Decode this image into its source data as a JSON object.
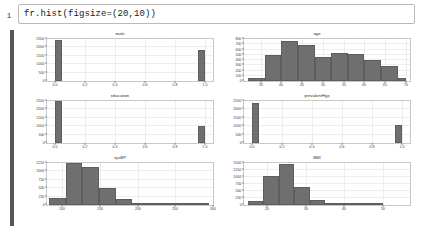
{
  "notebook": {
    "prompt_label": "1",
    "code": "fr.hist(figsize=(20,10))"
  },
  "chart_data": [
    {
      "type": "bar",
      "title": "male",
      "xlabel": "",
      "ylabel": "",
      "grid": true,
      "xlim": [
        -0.05,
        1.05
      ],
      "ylim": [
        0,
        2500
      ],
      "xticks": [
        "0.0",
        "0.2",
        "0.4",
        "0.6",
        "0.8",
        "1.0"
      ],
      "xtick_values": [
        0.0,
        0.2,
        0.4,
        0.6,
        0.8,
        1.0
      ],
      "yticks": [
        "0",
        "500",
        "1000",
        "1500",
        "2000",
        "2500"
      ],
      "ytick_values": [
        0,
        500,
        1000,
        1500,
        2000,
        2500
      ],
      "bins": [
        {
          "x0": 0.0,
          "x1": 0.05,
          "value": 2420
        },
        {
          "x0": 0.95,
          "x1": 1.0,
          "value": 1820
        }
      ]
    },
    {
      "type": "bar",
      "title": "age",
      "xlabel": "",
      "ylabel": "",
      "grid": true,
      "xlim": [
        31,
        71
      ],
      "ylim": [
        0,
        800
      ],
      "xticks": [
        "35",
        "40",
        "45",
        "50",
        "55",
        "60",
        "65",
        "70"
      ],
      "xtick_values": [
        35,
        40,
        45,
        50,
        55,
        60,
        65,
        70
      ],
      "yticks": [
        "0",
        "100",
        "200",
        "300",
        "400",
        "500",
        "600",
        "700",
        "800"
      ],
      "ytick_values": [
        0,
        100,
        200,
        300,
        400,
        500,
        600,
        700,
        800
      ],
      "bins": [
        {
          "x0": 32,
          "x1": 36,
          "value": 60
        },
        {
          "x0": 36,
          "x1": 40,
          "value": 490
        },
        {
          "x0": 40,
          "x1": 44,
          "value": 760
        },
        {
          "x0": 44,
          "x1": 48,
          "value": 690
        },
        {
          "x0": 48,
          "x1": 52,
          "value": 450
        },
        {
          "x0": 52,
          "x1": 56,
          "value": 530
        },
        {
          "x0": 56,
          "x1": 60,
          "value": 520
        },
        {
          "x0": 60,
          "x1": 64,
          "value": 400
        },
        {
          "x0": 64,
          "x1": 68,
          "value": 280
        },
        {
          "x0": 68,
          "x1": 70,
          "value": 55
        }
      ]
    },
    {
      "type": "bar",
      "title": "education",
      "xlabel": "",
      "ylabel": "",
      "grid": true,
      "xlim": [
        -0.05,
        1.05
      ],
      "ylim": [
        0,
        2500
      ],
      "xticks": [
        "0.0",
        "0.2",
        "0.4",
        "0.6",
        "0.8",
        "1.0"
      ],
      "xtick_values": [
        0.0,
        0.2,
        0.4,
        0.6,
        0.8,
        1.0
      ],
      "yticks": [
        "0",
        "500",
        "1000",
        "1500",
        "2000",
        "2500"
      ],
      "ytick_values": [
        0,
        500,
        1000,
        1500,
        2000,
        2500
      ],
      "bins": [
        {
          "x0": 0.0,
          "x1": 0.05,
          "value": 2490
        },
        {
          "x0": 0.95,
          "x1": 1.0,
          "value": 1010
        }
      ]
    },
    {
      "type": "bar",
      "title": "prevalentHyp",
      "xlabel": "",
      "ylabel": "",
      "grid": true,
      "xlim": [
        -0.05,
        1.05
      ],
      "ylim": [
        0,
        2500
      ],
      "xticks": [
        "0.0",
        "0.2",
        "0.4",
        "0.6",
        "0.8",
        "1.0"
      ],
      "xtick_values": [
        0.0,
        0.2,
        0.4,
        0.6,
        0.8,
        1.0
      ],
      "yticks": [
        "0",
        "500",
        "1000",
        "1500",
        "2000",
        "2500"
      ],
      "ytick_values": [
        0,
        500,
        1000,
        1500,
        2000,
        2500
      ],
      "bins": [
        {
          "x0": 0.0,
          "x1": 0.05,
          "value": 2400
        },
        {
          "x0": 0.95,
          "x1": 1.0,
          "value": 1090
        }
      ]
    },
    {
      "type": "bar",
      "title": "sysBP",
      "xlabel": "",
      "ylabel": "",
      "grid": true,
      "xlim": [
        80,
        300
      ],
      "ylim": [
        0,
        1250
      ],
      "xticks": [
        "100",
        "150",
        "200",
        "250",
        "300"
      ],
      "xtick_values": [
        100,
        150,
        200,
        250,
        300
      ],
      "yticks": [
        "0",
        "250",
        "500",
        "750",
        "1000",
        "1250"
      ],
      "ytick_values": [
        0,
        250,
        500,
        750,
        1000,
        1250
      ],
      "bins": [
        {
          "x0": 83,
          "x1": 105,
          "value": 210
        },
        {
          "x0": 105,
          "x1": 127,
          "value": 1250
        },
        {
          "x0": 127,
          "x1": 149,
          "value": 1130
        },
        {
          "x0": 149,
          "x1": 171,
          "value": 520
        },
        {
          "x0": 171,
          "x1": 193,
          "value": 180
        },
        {
          "x0": 193,
          "x1": 215,
          "value": 50
        },
        {
          "x0": 215,
          "x1": 237,
          "value": 18
        },
        {
          "x0": 237,
          "x1": 259,
          "value": 6
        },
        {
          "x0": 259,
          "x1": 295,
          "value": 3
        }
      ]
    },
    {
      "type": "bar",
      "title": "BMI",
      "xlabel": "",
      "ylabel": "",
      "grid": true,
      "xlim": [
        14,
        57
      ],
      "ylim": [
        0,
        1500
      ],
      "xticks": [
        "20",
        "30",
        "40",
        "50"
      ],
      "xtick_values": [
        20,
        30,
        40,
        50
      ],
      "yticks": [
        "0",
        "250",
        "500",
        "750",
        "1000",
        "1250",
        "1500"
      ],
      "ytick_values": [
        0,
        250,
        500,
        750,
        1000,
        1250,
        1500
      ],
      "bins": [
        {
          "x0": 15,
          "x1": 19,
          "value": 150
        },
        {
          "x0": 19,
          "x1": 23,
          "value": 1040
        },
        {
          "x0": 23,
          "x1": 27,
          "value": 1470
        },
        {
          "x0": 27,
          "x1": 31,
          "value": 640
        },
        {
          "x0": 31,
          "x1": 35,
          "value": 190
        },
        {
          "x0": 35,
          "x1": 39,
          "value": 60
        },
        {
          "x0": 39,
          "x1": 43,
          "value": 20
        },
        {
          "x0": 43,
          "x1": 50,
          "value": 8
        }
      ]
    }
  ],
  "style": {
    "bar_color": "#6f6f6f",
    "grid_color": "#e3e3e3",
    "frame_color": "#c8c8c8",
    "selection_bar_color": "#565656"
  }
}
